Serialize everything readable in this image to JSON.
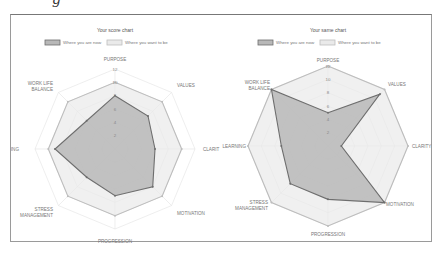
{
  "header_fragment": "g",
  "colors": {
    "now_fill": "#b8b8b8",
    "now_stroke": "#6e6e6e",
    "want_fill": "#eaeaea",
    "want_stroke": "#bdbdbd",
    "grid": "#e2e2e2",
    "border": "#9a9a9a"
  },
  "chart_data": [
    {
      "type": "radar",
      "title": "Your score chart",
      "legend": [
        "Where you are now",
        "Where you want to be"
      ],
      "legend_position": "top",
      "categories": [
        "PURPOSE",
        "VALUES",
        "CLARITY",
        "MOTIVATION",
        "PROGRESSION",
        "STRESS MANAGEMENT",
        "LEARNING",
        "WORK LIFE BALANCE"
      ],
      "visible_category_labels": [
        "PURPOSE",
        "VALUES",
        "CLARIT",
        "MOTIVATION",
        "PROGRESSION",
        "STRESS MANAGEMENT",
        "ARNING",
        "WORK LIFE BALANCE"
      ],
      "ticks": [
        "2",
        "4",
        "6",
        "8",
        "10",
        "12"
      ],
      "rlim": [
        0,
        12
      ],
      "grid": true,
      "series": [
        {
          "name": "Where you are now",
          "values": [
            8,
            7,
            6,
            8,
            7,
            6,
            9,
            6
          ]
        },
        {
          "name": "Where you want to be",
          "values": [
            10,
            10,
            10,
            10,
            10,
            10,
            10,
            10
          ]
        }
      ]
    },
    {
      "type": "radar",
      "title": "Your same chart",
      "legend": [
        "Where you are now",
        "Where you want to be"
      ],
      "legend_position": "top",
      "categories": [
        "PURPOSE",
        "VALUES",
        "CLARITY",
        "MOTIVATION",
        "PROGRESSION",
        "STRESS MANAGEMENT",
        "LEARNING",
        "WORK LIFE BALANCE"
      ],
      "visible_category_labels": [
        "PURPOSE",
        "VALUES",
        "CLARITY",
        "MOTIVATION",
        "PROGRESSION",
        "STRESS MANAGEMENT",
        "LEARNING",
        "WORK LIFE BALANCE"
      ],
      "ticks": [
        "2",
        "4",
        "6",
        "8",
        "10",
        "12"
      ],
      "rlim": [
        0,
        12
      ],
      "grid": true,
      "series": [
        {
          "name": "Where you are now",
          "values": [
            5,
            11,
            2,
            12,
            8,
            8,
            7,
            12
          ]
        },
        {
          "name": "Where you want to be",
          "values": [
            12,
            12,
            12,
            12,
            12,
            12,
            12,
            12
          ]
        }
      ]
    }
  ]
}
